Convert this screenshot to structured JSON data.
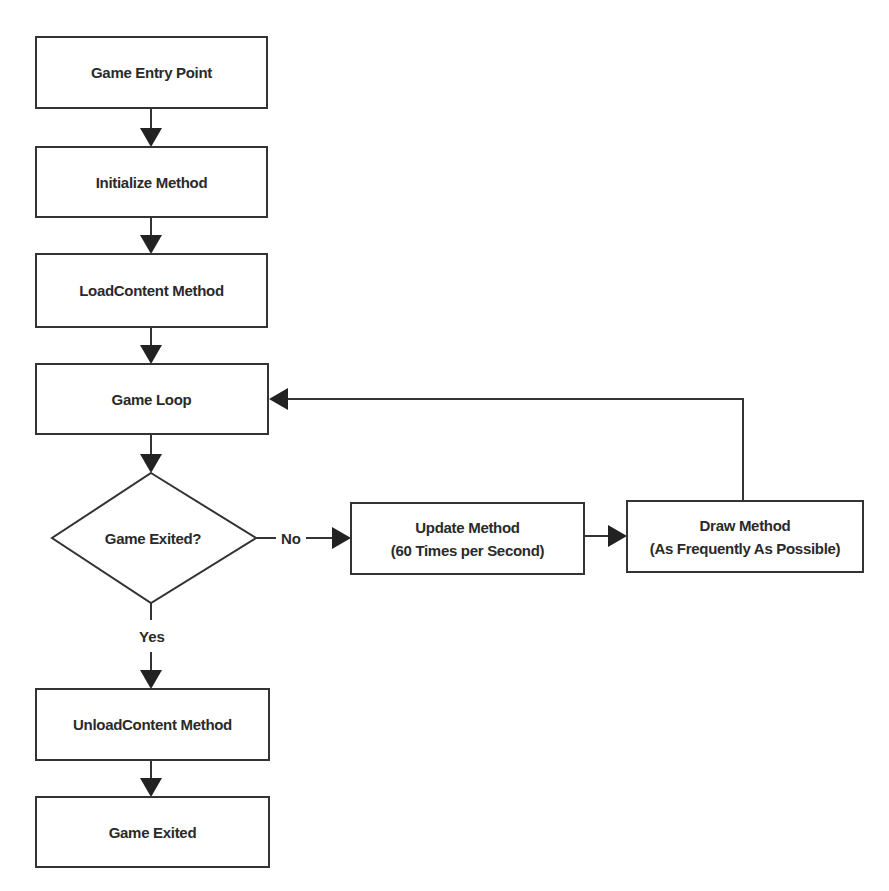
{
  "diagram": {
    "type": "flowchart",
    "nodes": {
      "entry": {
        "label": "Game Entry Point"
      },
      "initialize": {
        "label": "Initialize Method"
      },
      "load_content": {
        "label": "LoadContent Method"
      },
      "game_loop": {
        "label": "Game Loop"
      },
      "decision": {
        "label": "Game Exited?"
      },
      "update": {
        "line1": "Update Method",
        "line2": "(60 Times per Second)"
      },
      "draw": {
        "line1": "Draw Method",
        "line2": "(As Frequently As Possible)"
      },
      "unload_content": {
        "label": "UnloadContent Method"
      },
      "exited": {
        "label": "Game Exited"
      }
    },
    "edge_labels": {
      "no": "No",
      "yes": "Yes"
    },
    "edges": [
      [
        "entry",
        "initialize"
      ],
      [
        "initialize",
        "load_content"
      ],
      [
        "load_content",
        "game_loop"
      ],
      [
        "game_loop",
        "decision"
      ],
      [
        "decision",
        "update",
        "No"
      ],
      [
        "update",
        "draw"
      ],
      [
        "draw",
        "game_loop"
      ],
      [
        "decision",
        "unload_content",
        "Yes"
      ],
      [
        "unload_content",
        "exited"
      ]
    ],
    "colors": {
      "stroke": "#333333",
      "text": "#2a2a2a",
      "background": "#ffffff"
    }
  }
}
